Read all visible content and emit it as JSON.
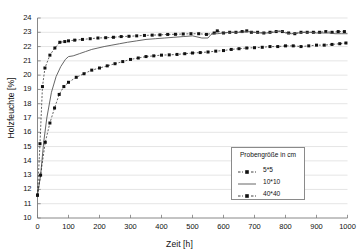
{
  "chart_data": {
    "type": "line",
    "title": "",
    "xlabel": "Zeit [h]",
    "ylabel": "Holzfeuchte [%]",
    "xlim": [
      0,
      1000
    ],
    "ylim": [
      10,
      24
    ],
    "xticks": [
      0,
      100,
      200,
      300,
      400,
      500,
      600,
      700,
      800,
      900,
      1000
    ],
    "yticks": [
      10,
      11,
      12,
      13,
      14,
      15,
      16,
      17,
      18,
      19,
      20,
      21,
      22,
      23,
      24
    ],
    "grid": "horizontal",
    "legend_position": "inside-bottom-right",
    "legend_title": "Probengröße in cm",
    "series": [
      {
        "name": "5*5",
        "style": "dashed-with-markers",
        "marker": "square",
        "color": "#111111",
        "x": [
          0,
          8,
          16,
          24,
          40,
          56,
          72,
          88,
          100,
          120,
          145,
          170,
          195,
          220,
          245,
          270,
          295,
          320,
          345,
          370,
          395,
          420,
          445,
          470,
          495,
          520,
          545,
          570,
          580,
          600,
          620,
          640,
          660,
          675,
          690,
          710,
          730,
          750,
          770,
          790,
          810,
          830,
          850,
          870,
          890,
          910,
          930,
          950,
          970,
          990
        ],
        "y": [
          11.6,
          15.2,
          19.2,
          20.5,
          21.4,
          21.9,
          22.3,
          22.35,
          22.4,
          22.45,
          22.5,
          22.55,
          22.6,
          22.62,
          22.65,
          22.7,
          22.72,
          22.75,
          22.78,
          22.8,
          22.82,
          22.85,
          22.86,
          22.88,
          22.9,
          22.9,
          22.85,
          22.95,
          23.1,
          22.95,
          23.0,
          23.0,
          23.05,
          23.1,
          23.0,
          23.0,
          22.95,
          23.0,
          23.05,
          23.05,
          22.95,
          22.9,
          23.0,
          23.0,
          23.0,
          23.0,
          23.05,
          23.0,
          23.05,
          23.05
        ]
      },
      {
        "name": "10*10",
        "style": "solid",
        "marker": "none",
        "color": "#555555",
        "x": [
          0,
          10,
          20,
          30,
          45,
          60,
          75,
          90,
          100,
          115,
          135,
          155,
          175,
          195,
          215,
          240,
          265,
          290,
          320,
          350,
          380,
          410,
          440,
          470,
          500,
          530,
          550,
          560,
          570,
          580,
          600,
          620,
          640,
          660,
          680,
          700,
          720,
          740,
          760,
          780,
          790,
          800,
          820,
          840,
          860,
          880,
          900,
          920,
          940,
          960,
          980,
          1000
        ],
        "y": [
          11.6,
          13.0,
          15.3,
          17.0,
          18.8,
          19.9,
          20.6,
          21.1,
          21.3,
          21.35,
          21.5,
          21.65,
          21.8,
          21.9,
          22.0,
          22.1,
          22.2,
          22.3,
          22.4,
          22.5,
          22.55,
          22.6,
          22.65,
          22.7,
          22.75,
          22.6,
          22.6,
          22.85,
          22.9,
          22.9,
          22.95,
          23.0,
          23.0,
          23.0,
          23.05,
          23.0,
          22.95,
          22.95,
          23.0,
          23.1,
          23.05,
          22.95,
          22.9,
          22.95,
          23.0,
          23.0,
          22.95,
          22.95,
          22.95,
          22.9,
          22.9,
          22.9
        ]
      },
      {
        "name": "40*40",
        "style": "dashed-with-markers",
        "marker": "square",
        "color": "#111111",
        "x": [
          0,
          10,
          25,
          40,
          55,
          70,
          85,
          100,
          125,
          150,
          175,
          200,
          225,
          250,
          275,
          300,
          325,
          350,
          375,
          400,
          425,
          450,
          475,
          500,
          525,
          550,
          575,
          600,
          625,
          650,
          675,
          700,
          725,
          750,
          775,
          800,
          825,
          850,
          875,
          900,
          925,
          950,
          975,
          995
        ],
        "y": [
          11.6,
          13.0,
          15.3,
          16.65,
          17.7,
          18.65,
          19.2,
          19.5,
          19.85,
          20.1,
          20.35,
          20.5,
          20.65,
          20.8,
          20.95,
          21.1,
          21.2,
          21.3,
          21.35,
          21.4,
          21.42,
          21.45,
          21.5,
          21.55,
          21.58,
          21.62,
          21.68,
          21.72,
          21.8,
          21.85,
          21.9,
          21.92,
          21.95,
          22.0,
          22.0,
          22.05,
          22.05,
          22.0,
          22.05,
          22.1,
          22.1,
          22.15,
          22.2,
          22.25
        ]
      }
    ]
  },
  "legend": {
    "title": "Probengröße in cm",
    "items": [
      {
        "label": "5*5"
      },
      {
        "label": "10*10"
      },
      {
        "label": "40*40"
      }
    ]
  },
  "axes": {
    "x_title": "Zeit [h]",
    "y_title": "Holzfeuchte [%]"
  }
}
